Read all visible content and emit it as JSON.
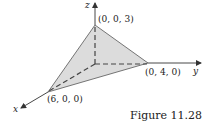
{
  "figure": {
    "caption": "Figure 11.28",
    "axes": {
      "x_label": "x",
      "y_label": "y",
      "z_label": "z"
    },
    "vertices": {
      "z_intercept": "(0, 0, 3)",
      "y_intercept": "(0, 4, 0)",
      "x_intercept": "(6, 0, 0)"
    },
    "colors": {
      "plane_fill": "#dcdcdc",
      "line": "#333333"
    }
  }
}
